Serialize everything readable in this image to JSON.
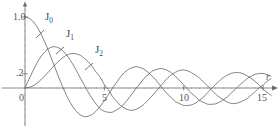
{
  "chart_data": {
    "type": "line",
    "title": "",
    "xlabel": "r",
    "ylabel": "",
    "xlim": [
      -0.4,
      16.0
    ],
    "ylim": [
      -0.55,
      1.15
    ],
    "grid": false,
    "legend_position": "inline-annotations",
    "x_ticks": [
      {
        "value": 0,
        "label": "0"
      },
      {
        "value": 5,
        "label": "5"
      },
      {
        "value": 10,
        "label": "10"
      },
      {
        "value": 15,
        "label": "15"
      }
    ],
    "y_ticks": [
      {
        "value": 1.0,
        "label": "1.0"
      },
      {
        "value": 0.2,
        "label": ".2"
      }
    ],
    "annotations": [
      {
        "text": "J",
        "sub": "0",
        "x_px": 45,
        "y_px": 16,
        "leader_from": [
          44,
          30
        ],
        "leader_to": [
          36,
          38
        ]
      },
      {
        "text": "J",
        "sub": "1",
        "x_px": 65,
        "y_px": 33,
        "leader_from": [
          64,
          47
        ],
        "leader_to": [
          56,
          54
        ]
      },
      {
        "text": "J",
        "sub": "2",
        "x_px": 94,
        "y_px": 49,
        "leader_from": [
          93,
          63
        ],
        "leader_to": [
          85,
          70
        ]
      }
    ],
    "series": [
      {
        "name": "J0",
        "label": "J₀",
        "color": "#5a5a5a",
        "description": "Bessel function of the first kind, order 0"
      },
      {
        "name": "J1",
        "label": "J₁",
        "color": "#5a5a5a",
        "description": "Bessel function of the first kind, order 1"
      },
      {
        "name": "J2",
        "label": "J₂",
        "color": "#5a5a5a",
        "description": "Bessel function of the first kind, order 2"
      }
    ],
    "x": [
      0,
      0.25,
      0.5,
      0.75,
      1,
      1.25,
      1.5,
      1.75,
      2,
      2.25,
      2.5,
      2.75,
      3,
      3.25,
      3.5,
      3.75,
      4,
      4.25,
      4.5,
      4.75,
      5,
      5.25,
      5.5,
      5.75,
      6,
      6.25,
      6.5,
      6.75,
      7,
      7.25,
      7.5,
      7.75,
      8,
      8.25,
      8.5,
      8.75,
      9,
      9.25,
      9.5,
      9.75,
      10,
      10.25,
      10.5,
      10.75,
      11,
      11.25,
      11.5,
      11.75,
      12,
      12.25,
      12.5,
      12.75,
      13,
      13.25,
      13.5,
      13.75,
      14,
      14.25,
      14.5,
      14.75,
      15,
      15.25,
      15.5,
      15.75,
      16
    ],
    "values": {
      "J0": [
        1.0,
        0.9844,
        0.9385,
        0.8642,
        0.7652,
        0.6459,
        0.5118,
        0.369,
        0.2239,
        0.0827,
        -0.0484,
        -0.1641,
        -0.2601,
        -0.3325,
        -0.3801,
        -0.4026,
        -0.3971,
        -0.3697,
        -0.3205,
        -0.2537,
        -0.1776,
        -0.0968,
        -0.0068,
        0.0719,
        0.1506,
        0.2159,
        0.2601,
        0.2855,
        0.3001,
        0.2869,
        0.2663,
        0.2211,
        0.1717,
        0.1105,
        0.0419,
        -0.0269,
        -0.0903,
        -0.1424,
        -0.1939,
        -0.221,
        -0.2459,
        -0.2459,
        -0.2366,
        -0.2117,
        -0.1712,
        -0.1267,
        -0.0677,
        -0.0068,
        0.0477,
        0.1002,
        0.1469,
        0.1808,
        0.2069,
        0.2167,
        0.215,
        0.2004,
        0.1711,
        0.136,
        0.0929,
        0.0438,
        -0.0142,
        -0.0612,
        -0.1056,
        -0.1423,
        -0.1749
      ],
      "J1": [
        0.0,
        0.124,
        0.2423,
        0.3492,
        0.4401,
        0.5106,
        0.5579,
        0.5802,
        0.5767,
        0.5483,
        0.4971,
        0.426,
        0.3391,
        0.2404,
        0.1374,
        0.0348,
        -0.066,
        -0.1538,
        -0.2311,
        -0.2951,
        -0.3276,
        -0.3414,
        -0.3414,
        -0.311,
        -0.2767,
        -0.2216,
        -0.1538,
        -0.0816,
        -0.0047,
        0.0599,
        0.1352,
        0.1863,
        0.2346,
        0.2596,
        0.2731,
        0.2673,
        0.2453,
        0.211,
        0.1613,
        0.106,
        0.0435,
        -0.0141,
        -0.0789,
        -0.1225,
        -0.1768,
        -0.2007,
        -0.2284,
        -0.229,
        -0.2234,
        -0.1996,
        -0.1655,
        -0.1246,
        -0.0703,
        -0.0196,
        0.038,
        0.0826,
        0.1334,
        0.1667,
        0.1934,
        0.2028,
        0.2051,
        0.1893,
        0.1663,
        0.132,
        0.0904
      ],
      "J2": [
        0.0,
        0.0078,
        0.0306,
        0.0666,
        0.1149,
        0.1711,
        0.2321,
        0.294,
        0.3528,
        0.4023,
        0.4461,
        0.4756,
        0.4861,
        0.4797,
        0.4586,
        0.416,
        0.3641,
        0.2988,
        0.2178,
        0.1497,
        0.0466,
        -0.0225,
        -0.1173,
        -0.1783,
        -0.2429,
        -0.281,
        -0.3074,
        -0.3139,
        -0.3014,
        -0.2712,
        -0.2301,
        -0.172,
        -0.113,
        -0.0486,
        0.0184,
        0.081,
        0.1448,
        0.1892,
        0.2238,
        0.2477,
        0.2546,
        0.2415,
        0.2145,
        0.1794,
        0.139,
        0.0854,
        0.03,
        -0.0254,
        -0.0849,
        -0.1285,
        -0.1662,
        -0.197,
        -0.2177,
        -0.2181,
        -0.2041,
        -0.179,
        -0.1475,
        -0.1004,
        -0.0522,
        0.0033,
        0.0416,
        0.0927,
        0.1332,
        0.162,
        0.1862
      ]
    }
  },
  "style": {
    "axis_color": "#6b6b6b",
    "curve_color": "#5a5a5a",
    "text_color": "#555555",
    "background": "#ffffff"
  }
}
